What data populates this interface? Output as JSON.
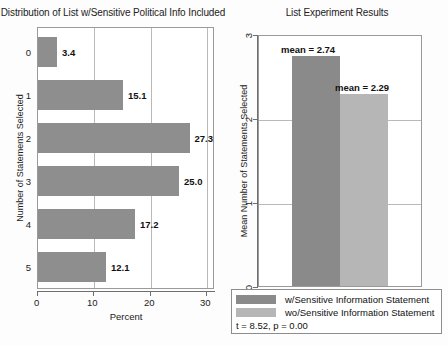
{
  "chart_data": [
    {
      "type": "bar",
      "orientation": "horizontal",
      "title": "Distribution of List w/Sensitive Political Info Included",
      "xlabel": "Percent",
      "ylabel": "Number of Statements Selected",
      "categories": [
        "0",
        "1",
        "2",
        "3",
        "4",
        "5"
      ],
      "values": [
        3.4,
        15.1,
        27.3,
        25.0,
        17.2,
        12.1
      ],
      "value_labels": [
        "3.4",
        "15.1",
        "27.3",
        "25.0",
        "17.2",
        "12.1"
      ],
      "xlim": [
        0,
        31.5
      ],
      "xticks": [
        0,
        10,
        20,
        30
      ],
      "xtick_labels": [
        "0",
        "10",
        "20",
        "30"
      ],
      "grid": "vertical",
      "bar_color": "#8e8e8e"
    },
    {
      "type": "bar",
      "orientation": "vertical",
      "title": "List Experiment Results",
      "xlabel": "",
      "ylabel": "Mean Number of Statements Selected",
      "categories": [
        "w/Sensitive Information Statement",
        "wo/Sensitive Information Statement"
      ],
      "values": [
        2.74,
        2.29
      ],
      "value_labels": [
        "mean = 2.74",
        "mean = 2.29"
      ],
      "ylim": [
        0,
        3
      ],
      "yticks": [
        0,
        1,
        2,
        3
      ],
      "ytick_labels": [
        "0",
        "1",
        "2",
        "3"
      ],
      "grid": "horizontal",
      "colors": [
        "#8a8a8a",
        "#b6b6b6"
      ],
      "legend": {
        "position": "bottom",
        "entries": [
          {
            "label": "w/Sensitive Information Statement",
            "color": "#8a8a8a"
          },
          {
            "label": "wo/Sensitive Information Statement",
            "color": "#b6b6b6"
          }
        ],
        "annotation": "t = 8.52, p = 0.00"
      }
    }
  ],
  "left": {
    "title": "Distribution of List w/Sensitive Political Info Included",
    "ylabel": "Number of Statements Selected",
    "xlabel": "Percent",
    "cats": [
      "0",
      "1",
      "2",
      "3",
      "4",
      "5"
    ],
    "vals": [
      "3.4",
      "15.1",
      "27.3",
      "25.0",
      "17.2",
      "12.1"
    ],
    "xticks": [
      "0",
      "10",
      "20",
      "30"
    ]
  },
  "right": {
    "title": "List Experiment Results",
    "ylabel": "Mean Number of Statements Selected",
    "yticks": [
      "0",
      "1",
      "2",
      "3"
    ],
    "bar1_label": "mean = 2.74",
    "bar2_label": "mean = 2.29"
  },
  "legend": {
    "entry1": "w/Sensitive Information Statement",
    "entry2": "wo/Sensitive Information Statement",
    "stat": "t = 8.52, p = 0.00"
  }
}
